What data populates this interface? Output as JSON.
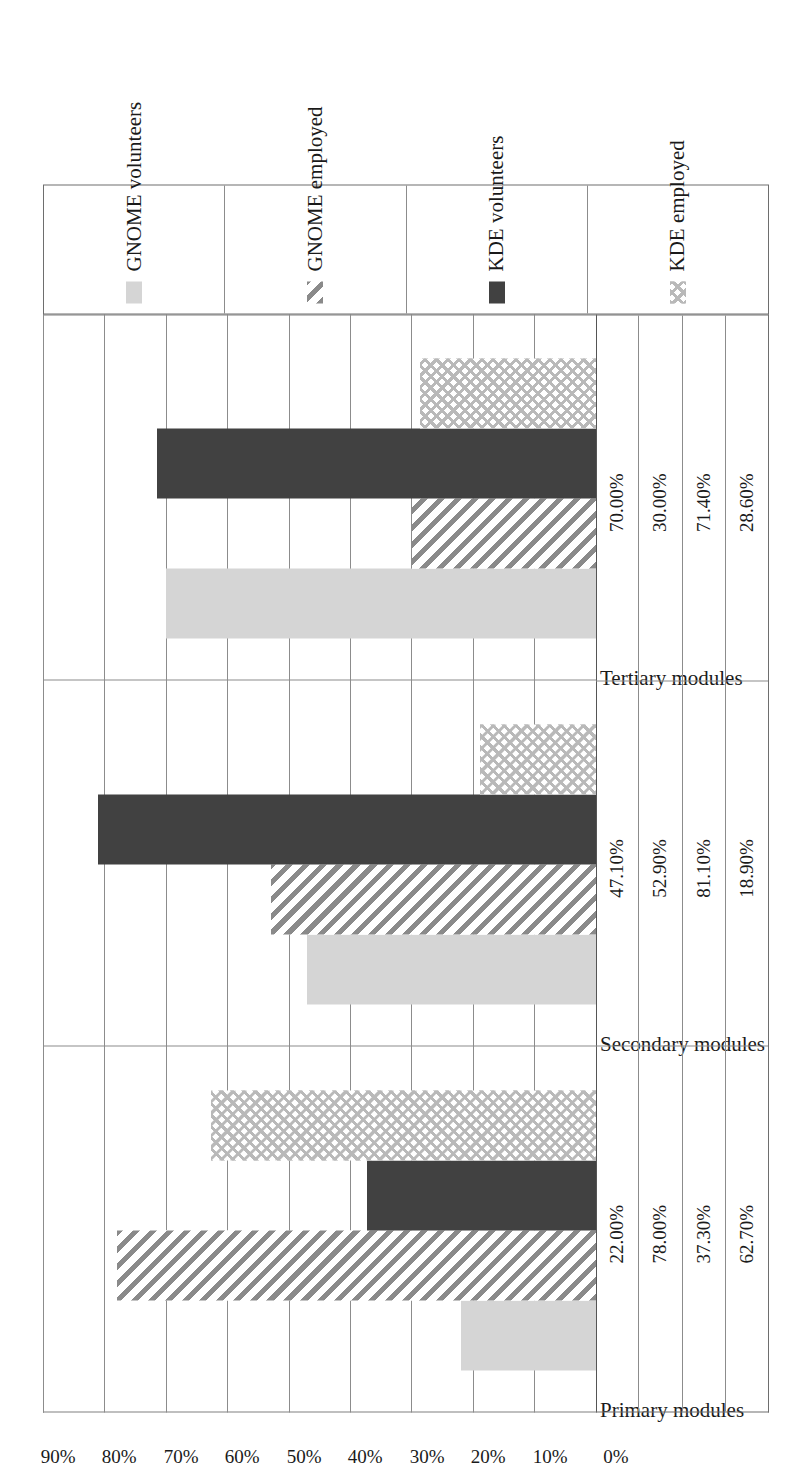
{
  "chart_data": {
    "type": "bar",
    "orientation": "horizontal",
    "title": "",
    "subtitle": "",
    "xlabel": "",
    "ylabel": "",
    "categories": [
      "Primary modules",
      "Secondary modules",
      "Tertiary modules"
    ],
    "series": [
      {
        "name": "GNOME volunteers",
        "fill": "light-gray-solid",
        "values": [
          22.0,
          47.1,
          70.0
        ]
      },
      {
        "name": "GNOME employed",
        "fill": "diagonal-hatch",
        "values": [
          78.0,
          52.9,
          30.0
        ]
      },
      {
        "name": "KDE volunteers",
        "fill": "dark-gray-solid",
        "values": [
          37.3,
          81.1,
          71.4
        ]
      },
      {
        "name": "KDE employed",
        "fill": "cross-hatch",
        "values": [
          62.7,
          18.9,
          28.6
        ]
      }
    ],
    "value_axis": {
      "min": 0,
      "max": 90,
      "step": 10,
      "tick_labels": [
        "90%",
        "80%",
        "70%",
        "60%",
        "50%",
        "40%",
        "30%",
        "20%",
        "10%",
        "0%"
      ],
      "ticks": [
        90,
        80,
        70,
        60,
        50,
        40,
        30,
        20,
        10,
        0
      ]
    },
    "grid": true,
    "legend_position": "bottom",
    "data_table": {
      "row_headers": [
        "GNOME volunteers",
        "GNOME employed",
        "KDE volunteers",
        "KDE employed"
      ],
      "column_headers": [
        "Primary modules",
        "Secondary modules",
        "Tertiary modules"
      ],
      "rows": [
        {
          "label": "GNOME volunteers",
          "cells": [
            "22.00%",
            "47.10%",
            "70.00%"
          ]
        },
        {
          "label": "GNOME employed",
          "cells": [
            "78.00%",
            "52.90%",
            "30.00%"
          ]
        },
        {
          "label": "KDE volunteers",
          "cells": [
            "37.30%",
            "81.10%",
            "71.40%"
          ]
        },
        {
          "label": "KDE employed",
          "cells": [
            "28.60%",
            "18.90%",
            "62.70%"
          ]
        }
      ]
    },
    "colors": {
      "light_gray": "#d5d5d5",
      "dark_gray": "#414141",
      "hatch_gray": "#8a8a8a",
      "cross_gray": "#b9b9b9",
      "gridline": "#8c8c8c",
      "axis": "#555555",
      "text": "#1a1a1a"
    }
  },
  "ticks": {
    "t0": "90%",
    "t1": "80%",
    "t2": "70%",
    "t3": "60%",
    "t4": "50%",
    "t5": "40%",
    "t6": "30%",
    "t7": "20%",
    "t8": "10%",
    "t9": "0%"
  },
  "categories": {
    "c0": "Primary modules",
    "c1": "Secondary modules",
    "c2": "Tertiary modules"
  },
  "table": {
    "r0": {
      "c0": "22.00%",
      "c1": "47.10%",
      "c2": "70.00%"
    },
    "r1": {
      "c0": "78.00%",
      "c1": "52.90%",
      "c2": "30.00%"
    },
    "r2": {
      "c0": "37.30%",
      "c1": "81.10%",
      "c2": "71.40%"
    },
    "r3": {
      "c0": "62.70%",
      "c1": "18.90%",
      "c2": "28.60%"
    }
  },
  "legend": {
    "l0": "GNOME volunteers",
    "l1": "GNOME employed",
    "l2": "KDE volunteers",
    "l3": "KDE employed"
  }
}
